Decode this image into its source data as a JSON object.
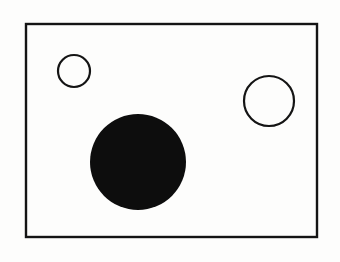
{
  "figure": {
    "title": "Rectangular frame containing three circles",
    "background_color": "#fdfdfc",
    "ink_color": "#111111",
    "canvas": {
      "width": 340,
      "height": 262
    },
    "frame": {
      "name": "outer-rectangle",
      "x": 26,
      "y": 24,
      "width": 291,
      "height": 213,
      "stroke_width": 2.4,
      "stroke_color": "#141414",
      "fill": "none"
    },
    "shapes": [
      {
        "name": "small-circle-outline",
        "kind": "circle",
        "fill": "none",
        "stroke_color": "#141414",
        "stroke_width": 2.2,
        "cx": 74,
        "cy": 71,
        "r": 16,
        "diameter": 32,
        "position_label": "upper-left"
      },
      {
        "name": "medium-circle-outline",
        "kind": "circle",
        "fill": "none",
        "stroke_color": "#141414",
        "stroke_width": 2.2,
        "cx": 269,
        "cy": 101,
        "r": 25,
        "diameter": 50,
        "position_label": "upper-right"
      },
      {
        "name": "large-filled-circle",
        "kind": "circle",
        "fill": "#0d0d0d",
        "stroke_color": "#0d0d0d",
        "stroke_width": 0,
        "cx": 138,
        "cy": 162,
        "r": 48,
        "diameter": 96,
        "position_label": "lower-center-left"
      }
    ]
  }
}
